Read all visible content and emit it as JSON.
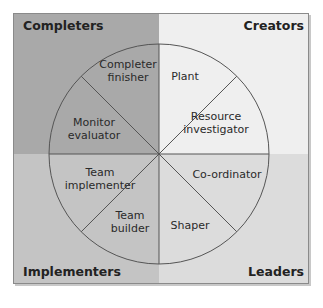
{
  "quadrants": {
    "top_left": {
      "label": "Completers",
      "color": "#a9a9a9"
    },
    "top_right": {
      "label": "Creators",
      "color": "#efefef"
    },
    "bottom_left": {
      "label": "Implementers",
      "color": "#c4c4c4"
    },
    "bottom_right": {
      "label": "Leaders",
      "color": "#dcdcdc"
    }
  },
  "roles": [
    {
      "line1": "Completer",
      "line2": "finisher"
    },
    {
      "line1": "Plant",
      "line2": ""
    },
    {
      "line1": "Resource",
      "line2": "investigator"
    },
    {
      "line1": "Co-ordinator",
      "line2": ""
    },
    {
      "line1": "Shaper",
      "line2": ""
    },
    {
      "line1": "Team",
      "line2": "builder"
    },
    {
      "line1": "Team",
      "line2": "implementer"
    },
    {
      "line1": "Monitor",
      "line2": "evaluator"
    }
  ]
}
